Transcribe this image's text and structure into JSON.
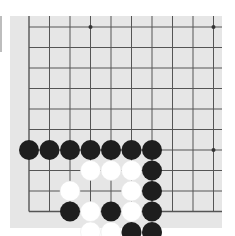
{
  "board": {
    "background": "#e6e6e6",
    "line_color": "#555555",
    "origin_x": 29,
    "origin_y": 27,
    "spacing": 20.5,
    "cols": 10,
    "rows": 10,
    "left_edge": true,
    "bottom_edge": true,
    "star_points": [
      [
        3,
        0
      ],
      [
        9,
        0
      ],
      [
        9,
        6
      ]
    ],
    "stones": [
      {
        "col": 0,
        "row": 6,
        "color": "black"
      },
      {
        "col": 1,
        "row": 6,
        "color": "black"
      },
      {
        "col": 2,
        "row": 6,
        "color": "black"
      },
      {
        "col": 3,
        "row": 6,
        "color": "black"
      },
      {
        "col": 4,
        "row": 6,
        "color": "black"
      },
      {
        "col": 5,
        "row": 6,
        "color": "black"
      },
      {
        "col": 6,
        "row": 6,
        "color": "black"
      },
      {
        "col": 3,
        "row": 7,
        "color": "white"
      },
      {
        "col": 4,
        "row": 7,
        "color": "white"
      },
      {
        "col": 5,
        "row": 7,
        "color": "white"
      },
      {
        "col": 6,
        "row": 7,
        "color": "black"
      },
      {
        "col": 2,
        "row": 8,
        "color": "white"
      },
      {
        "col": 5,
        "row": 8,
        "color": "white"
      },
      {
        "col": 6,
        "row": 8,
        "color": "black"
      },
      {
        "col": 2,
        "row": 9,
        "color": "black"
      },
      {
        "col": 3,
        "row": 9,
        "color": "white"
      },
      {
        "col": 4,
        "row": 9,
        "color": "black"
      },
      {
        "col": 5,
        "row": 9,
        "color": "white"
      },
      {
        "col": 6,
        "row": 9,
        "color": "black"
      },
      {
        "col": 3,
        "row": 10,
        "color": "white"
      },
      {
        "col": 4,
        "row": 10,
        "color": "white"
      },
      {
        "col": 5,
        "row": 10,
        "color": "black"
      },
      {
        "col": 6,
        "row": 10,
        "color": "black"
      }
    ],
    "colors": {
      "black": "#1e1e1e",
      "white": "#ffffff"
    }
  }
}
